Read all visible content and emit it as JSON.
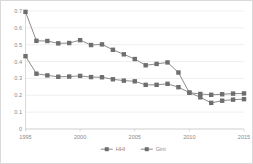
{
  "chart_data": {
    "type": "line",
    "title": "",
    "subtitle": "",
    "xlabel": "",
    "ylabel": "",
    "x": [
      1995,
      1996,
      1997,
      1998,
      1999,
      2000,
      2001,
      2002,
      2003,
      2004,
      2005,
      2006,
      2007,
      2008,
      2009,
      2010,
      2011,
      2012,
      2013,
      2014,
      2015
    ],
    "xlim": [
      1995,
      2015
    ],
    "ylim": [
      0,
      0.7
    ],
    "xticks": [
      1995,
      2000,
      2005,
      2010,
      2015
    ],
    "xtick_labels": [
      "1995",
      "2000",
      "2005",
      "2010",
      "2015"
    ],
    "yticks": [
      0,
      0.1,
      0.2,
      0.3,
      0.4,
      0.5,
      0.6,
      0.7
    ],
    "ytick_labels": [
      "0",
      "0.1",
      "0.2",
      "0.3",
      "0.4",
      "0.5",
      "0.6",
      "0.7"
    ],
    "grid": true,
    "grid_axis": "y",
    "legend_position": "bottom",
    "marker": "square",
    "series": [
      {
        "name": "HHI",
        "color": "#7f7f7f",
        "values": [
          0.695,
          0.523,
          0.522,
          0.508,
          0.51,
          0.527,
          0.498,
          0.502,
          0.47,
          0.443,
          0.415,
          0.378,
          0.386,
          0.395,
          0.335,
          0.215,
          0.208,
          0.203,
          0.206,
          0.21,
          0.211
        ]
      },
      {
        "name": "Gini",
        "color": "#7f7f7f",
        "values": [
          0.432,
          0.328,
          0.318,
          0.31,
          0.311,
          0.315,
          0.308,
          0.307,
          0.295,
          0.287,
          0.283,
          0.262,
          0.262,
          0.268,
          0.248,
          0.216,
          0.188,
          0.155,
          0.168,
          0.174,
          0.177
        ]
      }
    ]
  },
  "legend": {
    "items": [
      {
        "label": "HHI"
      },
      {
        "label": "Gini"
      }
    ]
  }
}
